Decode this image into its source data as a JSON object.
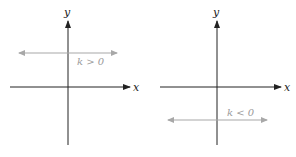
{
  "panels": [
    {
      "x_axis_label": "x",
      "y_axis_label": "y",
      "line_label": "k > 0",
      "line_position": "above x-axis"
    },
    {
      "x_axis_label": "x",
      "y_axis_label": "y",
      "line_label": "k < 0",
      "line_position": "below x-axis"
    }
  ],
  "colors": {
    "axis": "#222222",
    "horizontal_line": "#a8a8a8",
    "line_label": "#9a9a9a"
  }
}
